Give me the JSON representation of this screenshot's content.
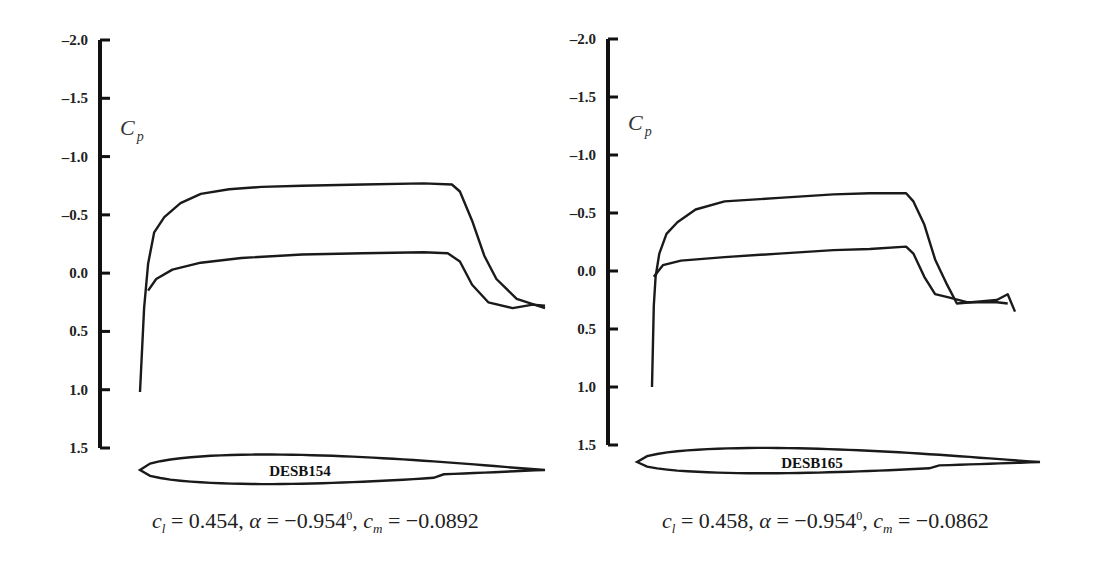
{
  "chart_data": [
    {
      "type": "line",
      "title": "",
      "ylabel": "C_p",
      "ylabel_main": "C",
      "ylabel_sub": "p",
      "xlabel": "",
      "ylim": [
        -2.0,
        1.5
      ],
      "y_inverted": true,
      "yticks": [
        "-2.0",
        "-1.5",
        "-1.0",
        "-0.5",
        "0.0",
        "0.5",
        "1.0",
        "1.5"
      ],
      "ytick_values": [
        -2.0,
        -1.5,
        -1.0,
        -0.5,
        0.0,
        0.5,
        1.0,
        1.5
      ],
      "airfoil_name": "DESB154",
      "coefficients": {
        "cl": "0.454",
        "alpha": "−0.954",
        "alpha_unit": "0",
        "cm": "−0.0892"
      },
      "series": [
        {
          "name": "upper-surface",
          "x": [
            0.0,
            0.01,
            0.02,
            0.035,
            0.06,
            0.1,
            0.15,
            0.22,
            0.3,
            0.4,
            0.55,
            0.7,
            0.77,
            0.79,
            0.82,
            0.85,
            0.88,
            0.93,
            1.0
          ],
          "y": [
            1.02,
            0.3,
            -0.08,
            -0.35,
            -0.48,
            -0.6,
            -0.68,
            -0.72,
            -0.74,
            -0.75,
            -0.76,
            -0.77,
            -0.76,
            -0.7,
            -0.45,
            -0.15,
            0.05,
            0.22,
            0.3
          ]
        },
        {
          "name": "lower-surface",
          "x": [
            0.02,
            0.04,
            0.08,
            0.15,
            0.25,
            0.4,
            0.55,
            0.7,
            0.76,
            0.79,
            0.82,
            0.86,
            0.92,
            0.97,
            1.0
          ],
          "y": [
            0.15,
            0.05,
            -0.03,
            -0.09,
            -0.13,
            -0.16,
            -0.17,
            -0.18,
            -0.17,
            -0.1,
            0.1,
            0.25,
            0.3,
            0.27,
            0.28
          ]
        }
      ]
    },
    {
      "type": "line",
      "title": "",
      "ylabel": "C_p",
      "ylabel_main": "C",
      "ylabel_sub": "p",
      "xlabel": "",
      "ylim": [
        -2.0,
        1.5
      ],
      "y_inverted": true,
      "yticks": [
        "-2.0",
        "-1.5",
        "-1.0",
        "-0.5",
        "0.0",
        "0.5",
        "1.0",
        "1.5"
      ],
      "ytick_values": [
        -2.0,
        -1.5,
        -1.0,
        -0.5,
        0.0,
        0.5,
        1.0,
        1.5
      ],
      "airfoil_name": "DESB165",
      "coefficients": {
        "cl": "0.458",
        "alpha": "−0.954",
        "alpha_unit": "0",
        "cm": "−0.0862"
      },
      "series": [
        {
          "name": "upper-surface",
          "x": [
            0.0,
            0.005,
            0.01,
            0.02,
            0.04,
            0.07,
            0.12,
            0.2,
            0.35,
            0.5,
            0.6,
            0.7,
            0.72,
            0.75,
            0.78,
            0.81,
            0.84,
            0.88,
            0.95,
            0.98,
            1.0
          ],
          "y": [
            1.0,
            0.3,
            0.05,
            -0.15,
            -0.32,
            -0.42,
            -0.53,
            -0.6,
            -0.63,
            -0.66,
            -0.67,
            -0.67,
            -0.6,
            -0.4,
            -0.1,
            0.1,
            0.28,
            0.27,
            0.25,
            0.2,
            0.35
          ]
        },
        {
          "name": "lower-surface",
          "x": [
            0.005,
            0.03,
            0.08,
            0.2,
            0.35,
            0.5,
            0.6,
            0.7,
            0.72,
            0.75,
            0.78,
            0.82,
            0.87,
            0.95,
            0.98
          ],
          "y": [
            0.05,
            -0.05,
            -0.09,
            -0.12,
            -0.15,
            -0.18,
            -0.19,
            -0.21,
            -0.15,
            0.05,
            0.2,
            0.23,
            0.27,
            0.27,
            0.28
          ]
        }
      ]
    }
  ]
}
